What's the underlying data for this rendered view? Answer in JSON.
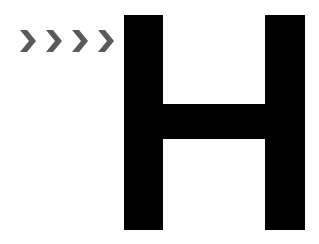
{
  "graphic": {
    "letter": "H",
    "letter_color": "#000000",
    "chevron_count": 4,
    "chevron_color": "#5a5a5a",
    "chevron_glyph": ">",
    "background": "#ffffff"
  }
}
